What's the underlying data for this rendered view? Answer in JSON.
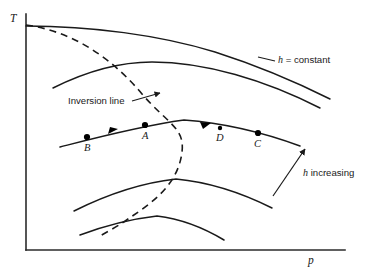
{
  "figure": {
    "name": "temperature-pressure-enthalpy-diagram",
    "background_color": "#ffffff",
    "line_color": "#1a1a1a",
    "axes": {
      "y_label": "T",
      "x_label": "p",
      "origin": {
        "x": 26,
        "y": 250
      },
      "y_top": {
        "x": 26,
        "y": 14
      },
      "x_right": {
        "x": 345,
        "y": 250
      }
    },
    "annotations": {
      "h_constant": {
        "italic_part": "h",
        "rest": " = constant",
        "x": 278,
        "y": 63
      },
      "inversion_line": {
        "label": "Inversion line",
        "x": 68,
        "y": 104
      },
      "h_increasing": {
        "italic_part": "h",
        "rest": " increasing",
        "x": 303,
        "y": 176
      }
    },
    "state_points": [
      {
        "label": "B",
        "cx": 87,
        "cy": 137,
        "label_x": 84,
        "label_y": 151
      },
      {
        "label": "A",
        "cx": 145,
        "cy": 125,
        "label_x": 142,
        "label_y": 139
      },
      {
        "label": "D",
        "cx": 220,
        "cy": 128,
        "label_x": 216,
        "label_y": 141
      },
      {
        "label": "C",
        "cx": 258,
        "cy": 133,
        "label_x": 254,
        "label_y": 147
      }
    ],
    "isenthalpic_curves": [
      {
        "id": "curve-1-highest",
        "path": "M 26,26 C 90,26 160,35 215,52 C 262,67 300,84 330,99"
      },
      {
        "id": "curve-2",
        "path": "M 53,88 C 85,72 120,62 152,62 C 205,62 265,80 320,108"
      },
      {
        "id": "curve-3-with-points",
        "path": "M 60,147 C 95,138 140,126 184,120 C 224,123 262,132 300,146"
      },
      {
        "id": "curve-4",
        "path": "M 74,211 C 104,196 140,183 176,179 C 208,182 240,192 272,208"
      },
      {
        "id": "curve-5-lowest",
        "path": "M 80,235 C 104,226 131,219 157,216 C 182,219 204,228 224,240"
      }
    ],
    "inversion_line_path": "M 26,25 C 72,31 112,58 142,94 C 168,124 185,128 182,152 C 178,186 150,204 128,219 C 115,228 105,233 100,236",
    "leaders": {
      "h_constant_leader": "M 275,61 L 258,57",
      "inversion_leader": "M 132,101 L 160,93",
      "trend_arrow": "M 273,196 L 305,149"
    },
    "flow_arrows": [
      {
        "id": "arrow-B-A",
        "points": "118,129 108,134 110,127",
        "note": "points left along curve-3"
      },
      {
        "id": "arrow-D-C",
        "points": "200,122 211,123 203,129",
        "note": "points left along curve-3"
      }
    ]
  }
}
